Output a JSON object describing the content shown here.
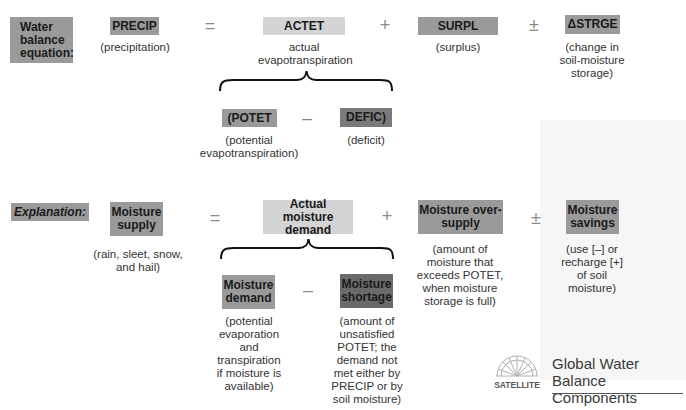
{
  "equation": {
    "label": "Water balance equation:",
    "label_lines": [
      "Water",
      "balance",
      "equation:"
    ],
    "terms": {
      "precip": {
        "code": "PRECIP",
        "caption": "(precipitation)"
      },
      "actet": {
        "code": "ACTET",
        "caption_lines": [
          "actual",
          "evapotranspiration"
        ]
      },
      "surpl": {
        "code": "SURPL",
        "caption": "(surplus)"
      },
      "strge": {
        "code": "ΔSTRGE",
        "caption_lines": [
          "(change in",
          "soil-moisture",
          "storage)"
        ]
      },
      "potet": {
        "code": "(POTET",
        "caption_lines": [
          "(potential",
          "evapotranspiration)"
        ]
      },
      "defic": {
        "code": "DEFIC)",
        "caption": "(deficit)"
      }
    },
    "operators": {
      "equals": "=",
      "plus": "+",
      "plusminus": "±",
      "minus": "–"
    }
  },
  "explanation": {
    "label": "Explanation:",
    "terms": {
      "supply": {
        "label_lines": [
          "Moisture",
          "supply"
        ],
        "caption_lines": [
          "(rain, sleet, snow,",
          "and hail)"
        ]
      },
      "actual_demand": {
        "label_lines": [
          "Actual moisture",
          "demand"
        ]
      },
      "oversupply": {
        "label_lines": [
          "Moisture over-",
          "supply"
        ],
        "caption_lines": [
          "(amount of",
          "moisture that",
          "exceeds POTET,",
          "when moisture",
          "storage is full)"
        ]
      },
      "savings": {
        "label_lines": [
          "Moisture",
          "savings"
        ],
        "caption_lines": [
          "(use [–] or",
          "recharge [+]",
          "of soil",
          "moisture)"
        ]
      },
      "demand": {
        "label_lines": [
          "Moisture",
          "demand"
        ],
        "caption_lines": [
          "(potential",
          "evaporation",
          "and",
          "transpiration",
          "if moisture is",
          "available)"
        ]
      },
      "shortage": {
        "label_lines": [
          "Moisture",
          "shortage"
        ],
        "caption_lines": [
          "(amount of",
          "unsatisfied",
          "POTET; the",
          "demand not",
          "met either by",
          "PRECIP or by",
          "soil moisture)"
        ]
      }
    },
    "operators": {
      "equals": "=",
      "plus": "+",
      "plusminus": "±",
      "minus": "–"
    }
  },
  "badge": {
    "logo_text": "SATELLITE",
    "title_lines": [
      "Global Water Balance",
      "Components"
    ]
  },
  "colors": {
    "box_mid": "#9a9a9a",
    "box_light": "#d4d4d4",
    "box_dark": "#7a7a7a",
    "box_darker": "#6a6a6a"
  }
}
